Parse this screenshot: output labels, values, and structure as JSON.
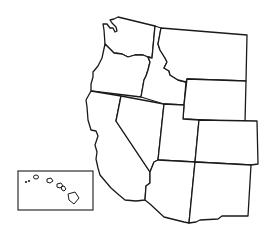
{
  "map": {
    "title": "",
    "region": "Western United States",
    "style": "outline",
    "colors": {
      "background": "#ffffff",
      "stroke": "#1a1a1a",
      "fill": "#ffffff"
    },
    "states": [
      {
        "name": "Washington"
      },
      {
        "name": "Oregon"
      },
      {
        "name": "California"
      },
      {
        "name": "Idaho"
      },
      {
        "name": "Nevada"
      },
      {
        "name": "Montana"
      },
      {
        "name": "Wyoming"
      },
      {
        "name": "Utah"
      },
      {
        "name": "Colorado"
      },
      {
        "name": "Arizona"
      },
      {
        "name": "New Mexico"
      }
    ],
    "inset": {
      "name": "Hawaii",
      "islands": 6
    }
  }
}
